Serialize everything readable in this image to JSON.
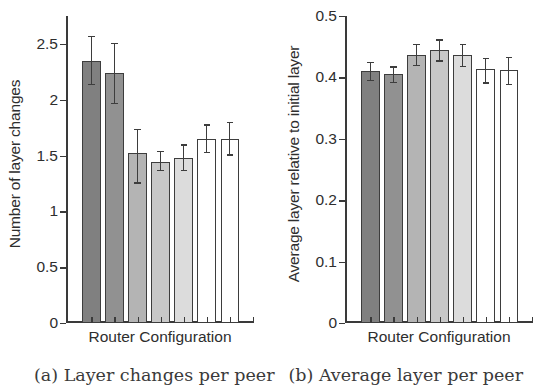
{
  "figure": {
    "captions": {
      "a": "(a) Layer changes per peer",
      "b": "(b) Average layer per peer"
    }
  },
  "chart_data": [
    {
      "panel": "a",
      "type": "bar",
      "title": "",
      "xlabel": "Router Configuration",
      "ylabel": "Number of layer changes",
      "categories": [
        "1",
        "2",
        "3",
        "4",
        "5",
        "6",
        "7"
      ],
      "xticklabels": [
        "",
        "",
        "",
        "",
        "",
        "",
        ""
      ],
      "yticklabels": [
        "0",
        "0.5",
        "1",
        "1.5",
        "2",
        "2.5"
      ],
      "ytickvalues": [
        0,
        0.5,
        1,
        1.5,
        2,
        2.5
      ],
      "ylim": [
        0,
        2.75
      ],
      "xlim": [
        0,
        8
      ],
      "grid": false,
      "legend": "none",
      "values": [
        2.35,
        2.24,
        1.52,
        1.44,
        1.48,
        1.65,
        1.65
      ],
      "err_low": [
        2.14,
        1.97,
        1.26,
        1.37,
        1.37,
        1.53,
        1.51
      ],
      "err_high": [
        2.57,
        2.51,
        1.74,
        1.54,
        1.6,
        1.78,
        1.8
      ],
      "bar_fills": [
        "#808080",
        "#919191",
        "#b4b4b4",
        "#c8c8c8",
        "#dcdcdc",
        "#ffffff",
        "#ffffff"
      ]
    },
    {
      "panel": "b",
      "type": "bar",
      "title": "",
      "xlabel": "Router Configuration",
      "ylabel": "Average layer relative to initial layer",
      "categories": [
        "1",
        "2",
        "3",
        "4",
        "5",
        "6",
        "7"
      ],
      "xticklabels": [
        "",
        "",
        "",
        "",
        "",
        "",
        ""
      ],
      "yticklabels": [
        "0",
        "0.1",
        "0.2",
        "0.3",
        "0.4",
        "0.5"
      ],
      "ytickvalues": [
        0,
        0.1,
        0.2,
        0.3,
        0.4,
        0.5
      ],
      "ylim": [
        0,
        0.5
      ],
      "xlim": [
        0,
        8
      ],
      "grid": false,
      "legend": "none",
      "values": [
        0.41,
        0.405,
        0.437,
        0.445,
        0.436,
        0.413,
        0.412
      ],
      "err_low": [
        0.396,
        0.393,
        0.42,
        0.428,
        0.419,
        0.392,
        0.39
      ],
      "err_high": [
        0.425,
        0.418,
        0.455,
        0.462,
        0.455,
        0.432,
        0.434
      ],
      "bar_fills": [
        "#808080",
        "#919191",
        "#b4b4b4",
        "#c8c8c8",
        "#dcdcdc",
        "#ffffff",
        "#ffffff"
      ]
    }
  ]
}
